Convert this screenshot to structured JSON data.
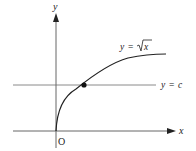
{
  "figure": {
    "axes": {
      "x_label": "x",
      "y_label": "y",
      "origin_label": "O"
    },
    "curve": {
      "label_lhs": "y",
      "label_eq": "=",
      "label_rhs": "x",
      "label_full": "y = √x",
      "color": "#222222"
    },
    "horizontal_line": {
      "label_lhs": "y",
      "label_eq": "=",
      "label_rhs": "c",
      "label_full": "y = c",
      "color": "#777777"
    },
    "intersection_point": {
      "description": "intersection of y = √x and y = c"
    }
  }
}
